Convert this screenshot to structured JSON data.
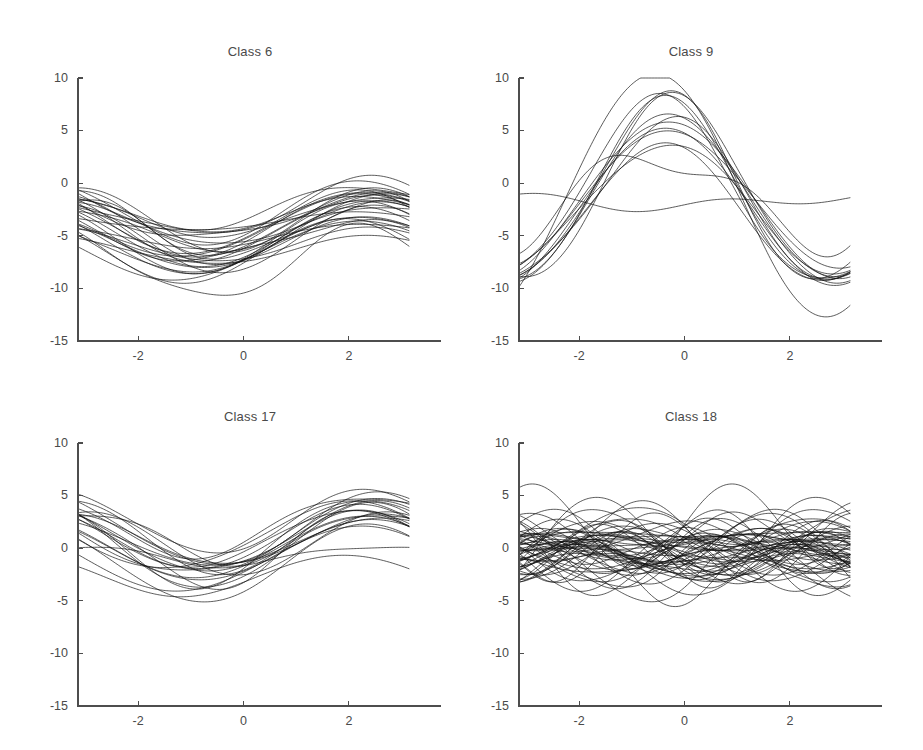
{
  "figure": {
    "background": "#ffffff",
    "line_color": "#111111",
    "axis_color": "#4d4d4d",
    "text_color": "#4a4a4a",
    "width": 923,
    "height": 750
  },
  "chart_data": [
    {
      "type": "line",
      "title": "Class 6",
      "xlabel": "",
      "ylabel": "",
      "xlim": [
        -3.14159,
        3.14159
      ],
      "ylim": [
        -15,
        10
      ],
      "xticks": [
        -2,
        0,
        2
      ],
      "xtick_labels": [
        "-2",
        "0",
        "2"
      ],
      "yticks": [
        10,
        5,
        0,
        -5,
        -10,
        -15
      ],
      "ytick_labels": [
        "10",
        "5",
        "0",
        "-5",
        "-10",
        "-15"
      ],
      "grid": false,
      "legend": "none",
      "n_curves": 30,
      "description": "Dense bundle of phase-shifted sinusoids; mean level about -5, amplitude about 2.5, single trough near x = -0.8 and rising toward both ends.",
      "series_model": {
        "form": "offset + amplitude * cos(freq * (x - phase))",
        "offset_mean": -4.9,
        "offset_spread": 1.3,
        "amplitude_mean": 2.4,
        "amplitude_spread": 0.8,
        "freq_mean": 1.0,
        "freq_spread": 0.06,
        "phase_mean": 2.35,
        "phase_spread": 0.22,
        "seed": 17
      },
      "value_range_observed": {
        "min": -9.4,
        "max": -0.6,
        "left_edge_min": -5.6,
        "left_edge_max": -1.3,
        "right_edge_min": -5.4,
        "right_edge_max": -1.6,
        "trough_x": -0.8
      }
    },
    {
      "type": "line",
      "title": "Class 9",
      "xlabel": "",
      "ylabel": "",
      "xlim": [
        -3.14159,
        3.14159
      ],
      "ylim": [
        -15,
        10
      ],
      "xticks": [
        -2,
        0,
        2
      ],
      "xtick_labels": [
        "-2",
        "0",
        "2"
      ],
      "yticks": [
        10,
        5,
        0,
        -5,
        -10,
        -15
      ],
      "ytick_labels": [
        "10",
        "5",
        "0",
        "-5",
        "-10",
        "-15"
      ],
      "grid": false,
      "legend": "none",
      "n_curves": 14,
      "description": "Large-amplitude sinusoids with a single broad peak near x = -0.4 reaching about 7, falling to roughly -10 at the left edge and -8 to -10 at the right edge.",
      "series_model": {
        "form": "offset + amplitude * cos(freq * (x - phase))",
        "offset_mean": -1.5,
        "offset_spread": 0.7,
        "amplitude_mean": 7.0,
        "amplitude_spread": 2.4,
        "freq_mean": 1.0,
        "freq_spread": 0.05,
        "phase_mean": -0.38,
        "phase_spread": 0.13,
        "seed": 41
      },
      "value_range_observed": {
        "min": -10.1,
        "max": 7.2,
        "left_edge_min": -9.9,
        "left_edge_max": -5.0,
        "right_edge_min": -10.2,
        "right_edge_max": -5.1,
        "peak_x": -0.4
      }
    },
    {
      "type": "line",
      "title": "Class 17",
      "xlabel": "",
      "ylabel": "",
      "xlim": [
        -3.14159,
        3.14159
      ],
      "ylim": [
        -15,
        10
      ],
      "xticks": [
        -2,
        0,
        2
      ],
      "xtick_labels": [
        "-2",
        "0",
        "2"
      ],
      "yticks": [
        10,
        5,
        0,
        -5,
        -10,
        -15
      ],
      "ytick_labels": [
        "10",
        "5",
        "0",
        "-5",
        "-10",
        "-15"
      ],
      "grid": false,
      "legend": "none",
      "n_curves": 22,
      "description": "Sinusoid family centred near +0.5 with amplitude about 3; starts near +3.5 at the left, dips to about -3 near x = -0.8 and climbs to roughly +4.5 past x = 2.",
      "series_model": {
        "form": "offset + amplitude * cos(freq * (x - phase))",
        "offset_mean": 0.55,
        "offset_spread": 0.9,
        "amplitude_mean": 2.9,
        "amplitude_spread": 0.8,
        "freq_mean": 1.0,
        "freq_spread": 0.05,
        "phase_mean": 2.35,
        "phase_spread": 0.18,
        "seed": 73
      },
      "value_range_observed": {
        "min": -3.2,
        "max": 4.7,
        "left_edge_min": 1.2,
        "left_edge_max": 4.4,
        "right_edge_min": 1.5,
        "right_edge_max": 4.4,
        "trough_x": -0.8
      }
    },
    {
      "type": "line",
      "title": "Class 18",
      "xlabel": "",
      "ylabel": "",
      "xlim": [
        -3.14159,
        3.14159
      ],
      "ylim": [
        -15,
        10
      ],
      "xticks": [
        -2,
        0,
        2
      ],
      "xtick_labels": [
        "-2",
        "0",
        "2"
      ],
      "yticks": [
        10,
        5,
        0,
        -5,
        -10,
        -15
      ],
      "ytick_labels": [
        "10",
        "5",
        "0",
        "-5",
        "-10",
        "-15"
      ],
      "grid": false,
      "legend": "none",
      "n_curves": 60,
      "description": "Very dense band of higher-frequency sinusoids centred on 0, amplitude about 2 to 3, with visible waists near x = -0.5 and x = 1.5 giving roughly one and a half cycles across the range.",
      "series_model": {
        "form": "offset + amplitude * cos(freq * (x - phase))",
        "offset_mean": -0.25,
        "offset_spread": 0.9,
        "amplitude_mean": 1.9,
        "amplitude_spread": 1.0,
        "freq_mean": 1.55,
        "freq_spread": 0.12,
        "phase_mean": 0.0,
        "phase_spread": 2.6,
        "seed": 9
      },
      "value_range_observed": {
        "min": -4.6,
        "max": 3.3,
        "left_edge_min": -3.7,
        "left_edge_max": 2.8,
        "right_edge_min": -3.8,
        "right_edge_max": 2.6,
        "waist_x": [
          -0.5,
          1.5
        ]
      }
    }
  ],
  "panels": [
    {
      "id": "class6",
      "title": "Class 6"
    },
    {
      "id": "class9",
      "title": "Class 9"
    },
    {
      "id": "class17",
      "title": "Class 17"
    },
    {
      "id": "class18",
      "title": "Class 18"
    }
  ]
}
